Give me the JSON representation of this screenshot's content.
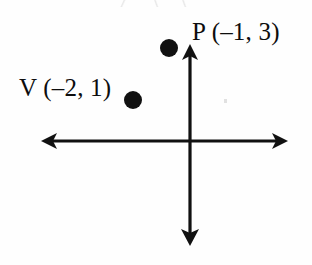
{
  "diagram": {
    "type": "coordinate-plane-scatter",
    "background_color": "#fefefe",
    "stroke_color": "#111111",
    "axes": {
      "origin": {
        "x": 190,
        "y": 141
      },
      "x_axis": {
        "from_x": 41,
        "to_x": 288,
        "y": 141,
        "arrows": [
          "left",
          "right"
        ]
      },
      "y_axis": {
        "x": 190,
        "from_y": 44,
        "to_y": 246,
        "arrows": [
          "up",
          "down"
        ]
      },
      "tick_labels": [],
      "grid": false
    },
    "points": [
      {
        "name": "P",
        "label": "P (–1, 3)",
        "x": -1,
        "y": 3,
        "px": 169,
        "py": 48
      },
      {
        "name": "V",
        "label": "V (–2, 1)",
        "x": -2,
        "y": 1,
        "px": 133,
        "py": 100
      }
    ]
  }
}
